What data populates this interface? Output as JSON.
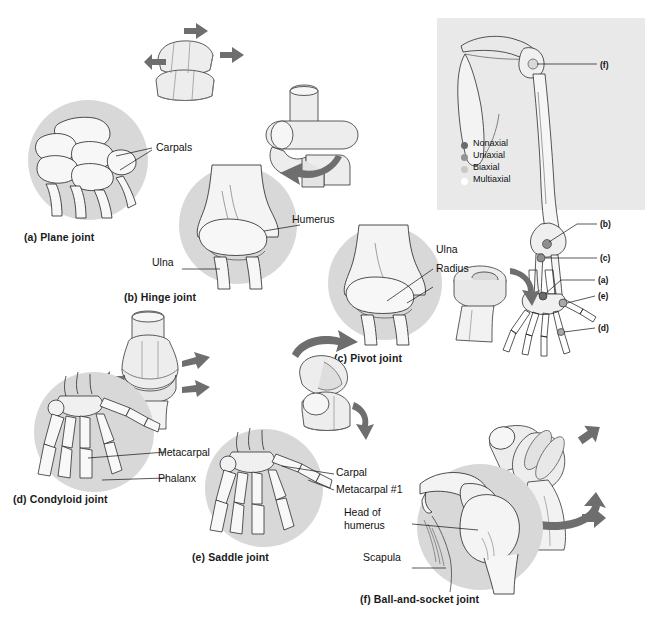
{
  "figure": {
    "background_color": "#ffffff",
    "inset_panel_color": "#e9e9e9",
    "bone_circle_color": "#d8d8d8",
    "arrow_color": "#6e6e6e",
    "bone_fill": "#f2f2f2",
    "bone_shade": "#dcdcdc",
    "outline_color": "#1a1a1a"
  },
  "panels": [
    {
      "key": "a",
      "caption": "(a)  Plane joint",
      "caption_letter": "(a)",
      "caption_name": "Plane joint",
      "labels": [
        "Carpals"
      ],
      "model": "two stacked flat blocks that glide",
      "axis_class": "Nonaxial"
    },
    {
      "key": "b",
      "caption": "(b)  Hinge joint",
      "caption_letter": "(b)",
      "caption_name": "Hinge joint",
      "labels": [
        "Humerus",
        "Ulna"
      ],
      "model": "cylinder seated in a trough",
      "axis_class": "Uniaxial"
    },
    {
      "key": "c",
      "caption": "(c)  Pivot joint",
      "caption_letter": "(c)",
      "caption_name": "Pivot joint",
      "labels": [
        "Ulna",
        "Radius"
      ],
      "model": "rounded peg rotating in a ring",
      "axis_class": "Uniaxial"
    },
    {
      "key": "d",
      "caption": "(d)  Condyloid joint",
      "caption_letter": "(d)",
      "caption_name": "Condyloid joint",
      "labels": [
        "Metacarpal",
        "Phalanx"
      ],
      "model": "oval condyle in elliptical socket",
      "axis_class": "Biaxial"
    },
    {
      "key": "e",
      "caption": "(e)  Saddle joint",
      "caption_letter": "(e)",
      "caption_name": "Saddle joint",
      "labels": [
        "Carpal",
        "Metacarpal #1"
      ],
      "model": "two saddle-shaped surfaces",
      "axis_class": "Biaxial"
    },
    {
      "key": "f",
      "caption": "(f)  Ball-and-socket joint",
      "caption_letter": "(f)",
      "caption_name": "Ball-and-socket joint",
      "labels": [
        "Head of",
        "humerus",
        "Scapula"
      ],
      "label_head_of_humerus": "Head of\nhumerus",
      "model": "sphere in a cup",
      "axis_class": "Multiaxial"
    }
  ],
  "inset": {
    "name": "upper-limb-skeleton-overview",
    "callouts": [
      "(f)",
      "(b)",
      "(c)",
      "(a)",
      "(e)",
      "(d)"
    ],
    "legend": {
      "title": "",
      "items": [
        {
          "label": "Nonaxial",
          "color": "#6b6b6b",
          "has_dot": true
        },
        {
          "label": "Uniaxial",
          "color": "#8f8f8f",
          "has_dot": true
        },
        {
          "label": "Biaxial",
          "color": "#c4c4c4",
          "has_dot": true
        },
        {
          "label": "Multiaxial",
          "color": "#ffffff",
          "has_dot": false
        }
      ]
    }
  }
}
